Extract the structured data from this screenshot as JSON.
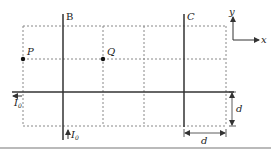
{
  "diagram": {
    "wires": [
      {
        "id": "B",
        "label": "B",
        "orientation": "vertical",
        "current_label": "I",
        "current_subscript": "0",
        "current_direction": "up"
      },
      {
        "id": "C",
        "label": "C",
        "orientation": "vertical"
      },
      {
        "id": "horizontal",
        "orientation": "horizontal",
        "current_label": "I",
        "current_subscript": "0",
        "current_direction": "left"
      }
    ],
    "points": [
      {
        "id": "P",
        "label": "P"
      },
      {
        "id": "Q",
        "label": "Q"
      }
    ],
    "axes": {
      "x_label": "x",
      "y_label": "y"
    },
    "dimensions": [
      {
        "id": "vertical-spacing",
        "label": "d"
      },
      {
        "id": "horizontal-spacing",
        "label": "d"
      }
    ],
    "colors": {
      "line": "#333333",
      "grid": "#888888",
      "text": "#222222"
    }
  }
}
